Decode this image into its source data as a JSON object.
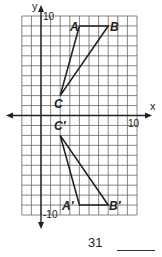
{
  "problem": {
    "number": "31",
    "answer_blank": ""
  },
  "graph": {
    "x_axis_label": "x",
    "y_axis_label": "y",
    "x_tick_label": "10",
    "y_top_tick_label": "10",
    "y_bottom_tick_label": "-10",
    "grid": {
      "x_min": -2,
      "x_max": 10,
      "y_min": -10,
      "y_max": 10
    },
    "preimage": {
      "labels": {
        "A": "A",
        "B": "B",
        "C": "C"
      },
      "points": {
        "A": [
          4,
          9
        ],
        "B": [
          7,
          9
        ],
        "C": [
          2,
          2
        ]
      }
    },
    "image": {
      "labels": {
        "A": "A′",
        "B": "B′",
        "C": "C′"
      },
      "points": {
        "A": [
          4,
          -9
        ],
        "B": [
          7,
          -9
        ],
        "C": [
          2,
          -2
        ]
      }
    },
    "colors": {
      "grid": "#555555",
      "axis": "#222222",
      "triangle": "#222222"
    }
  }
}
